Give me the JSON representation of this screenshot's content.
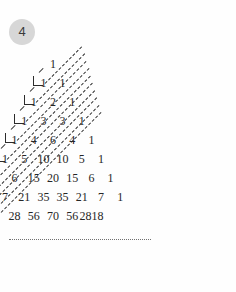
{
  "page": {
    "badge_label": "4",
    "background_color": "#fefefe",
    "ink_color": "#262626",
    "badge_color": "#d7d7d7"
  },
  "figure": {
    "name": "pascals-triangle-with-fibonacci-diagonals",
    "title": "Pascal's triangle",
    "continuation_marker": "dotted-line"
  },
  "chart_data": {
    "type": "table",
    "title": "Pascal's triangle",
    "xlabel": "",
    "ylabel": "",
    "rows": [
      {
        "index": 0,
        "values": [
          "1"
        ]
      },
      {
        "index": 1,
        "values": [
          "1",
          "1"
        ]
      },
      {
        "index": 2,
        "values": [
          "1",
          "2",
          "1"
        ]
      },
      {
        "index": 3,
        "values": [
          "1",
          "3",
          "3",
          "1"
        ]
      },
      {
        "index": 4,
        "values": [
          "1",
          "4",
          "6",
          "4",
          "1"
        ]
      },
      {
        "index": 5,
        "values": [
          "1",
          "5",
          "10",
          "10",
          "5",
          "1"
        ]
      },
      {
        "index": 6,
        "values": [
          "1",
          "6",
          "15",
          "20",
          "15",
          "6",
          "1"
        ]
      },
      {
        "index": 7,
        "values": [
          "1",
          "7",
          "21",
          "35",
          "35",
          "21",
          "7",
          "1"
        ]
      },
      {
        "index": 8,
        "values": [
          "1",
          "8",
          "28",
          "56",
          "70",
          "56",
          "2818"
        ]
      },
      {
        "index": 9,
        "values": [
          "1",
          "9"
        ]
      }
    ],
    "annotations": {
      "diagonal_lines": 10,
      "left_corner_marks": 11,
      "dotted_continuation": true
    }
  }
}
